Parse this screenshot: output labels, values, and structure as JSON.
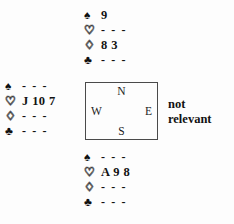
{
  "diagram": {
    "type": "bridge-deal",
    "suit_symbols": {
      "spades": "♠",
      "hearts": "♡",
      "diamonds": "♢",
      "clubs": "♣"
    },
    "void_marker": "- - -",
    "hands": {
      "north": {
        "label": "North",
        "spades": "9",
        "hearts": "- - -",
        "diamonds": "8 3",
        "clubs": "- - -"
      },
      "west": {
        "label": "West",
        "spades": "- - -",
        "hearts": "J 10 7",
        "diamonds": "- - -",
        "clubs": "- - -"
      },
      "east": {
        "label": "East",
        "note_line1": "not",
        "note_line2": "relevant"
      },
      "south": {
        "label": "South",
        "spades": "- - -",
        "hearts": "A 9 8",
        "diamonds": "- - -",
        "clubs": "- - -"
      }
    },
    "compass": {
      "north": "N",
      "west": "W",
      "east": "E",
      "south": "S"
    }
  }
}
